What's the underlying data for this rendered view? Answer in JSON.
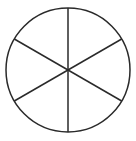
{
  "figure": {
    "name": "fraction-circle-sixths",
    "background_color": "#ffffff",
    "stroke_color": "#2a2a2a",
    "stroke_width": 1.5,
    "canvas": {
      "width": 136,
      "height": 141
    }
  },
  "chart_data": {
    "type": "pie",
    "title": "",
    "subtitle": "",
    "xlabel": "",
    "ylabel": "",
    "categories": [
      "sector-1",
      "sector-2",
      "sector-3",
      "sector-4",
      "sector-5",
      "sector-6"
    ],
    "values": [
      1,
      1,
      1,
      1,
      1,
      1
    ],
    "slice_fraction": "1/6",
    "slice_degrees": 60,
    "total_slices": 6,
    "filled_slices": 0,
    "labels_shown": false,
    "legend": [],
    "legend_position": "none",
    "grid": false,
    "slice_colors": [
      "#ffffff",
      "#ffffff",
      "#ffffff",
      "#ffffff",
      "#ffffff",
      "#ffffff"
    ],
    "outline_color": "#2a2a2a",
    "geometry": {
      "center_x": 68,
      "center_y": 70,
      "radius": 62,
      "diameter_count": 3,
      "diameter_angles_deg": [
        90,
        30,
        150
      ]
    }
  }
}
